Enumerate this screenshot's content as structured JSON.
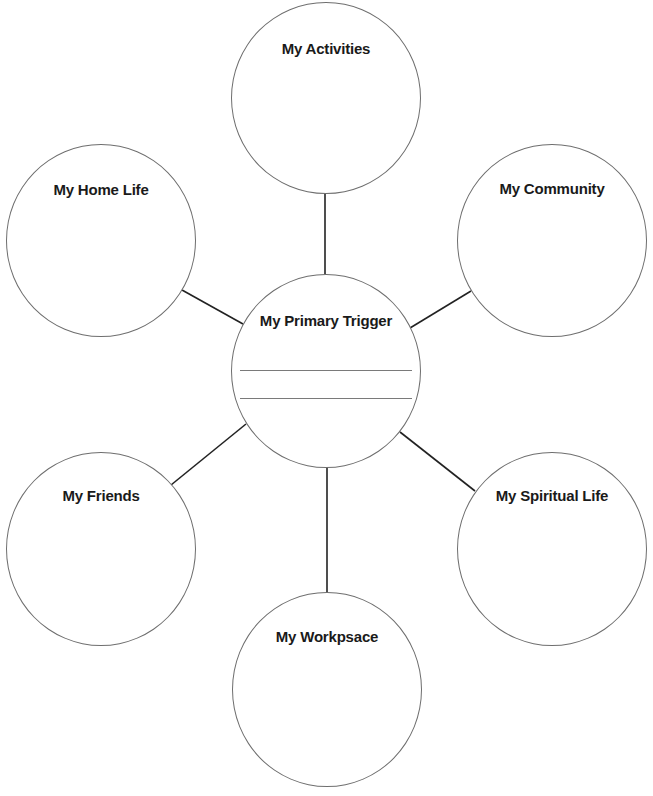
{
  "diagram": {
    "type": "mind-map",
    "center": {
      "id": "primary-trigger",
      "label": "My Primary Trigger",
      "blank_lines": 2
    },
    "nodes": [
      {
        "id": "activities",
        "label": "My Activities",
        "position": "top"
      },
      {
        "id": "home-life",
        "label": "My Home Life",
        "position": "upper-left"
      },
      {
        "id": "community",
        "label": "My Community",
        "position": "upper-right"
      },
      {
        "id": "friends",
        "label": "My Friends",
        "position": "lower-left"
      },
      {
        "id": "spiritual-life",
        "label": "My Spiritual Life",
        "position": "lower-right"
      },
      {
        "id": "workspace",
        "label": "My Workpsace",
        "position": "bottom"
      }
    ],
    "edges": [
      {
        "from": "primary-trigger",
        "to": "activities"
      },
      {
        "from": "primary-trigger",
        "to": "home-life"
      },
      {
        "from": "primary-trigger",
        "to": "community"
      },
      {
        "from": "primary-trigger",
        "to": "friends"
      },
      {
        "from": "primary-trigger",
        "to": "spiritual-life"
      },
      {
        "from": "primary-trigger",
        "to": "workspace"
      }
    ],
    "colors": {
      "circle_stroke": "#6e6e6e",
      "connector": "#222222",
      "text": "#1a1a1a",
      "background": "#ffffff"
    }
  }
}
